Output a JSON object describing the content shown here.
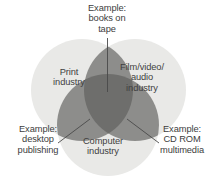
{
  "diagram": {
    "type": "venn-3-circle",
    "background_color": "#ffffff",
    "circle_fill": "#e9e9e7",
    "pair_overlap_fill": "#8d8d8b",
    "triple_overlap_fill": "#6e6e6c",
    "text_color": "#3d3d3d",
    "leader_line_color": "#4a4a4a"
  },
  "sets": [
    {
      "id": "print",
      "label": "Print\nindustry",
      "position": "left"
    },
    {
      "id": "film_video_audio",
      "label": "Film/video/\naudio\nindustry",
      "position": "right"
    },
    {
      "id": "computer",
      "label": "Computer\nindustry",
      "position": "bottom"
    }
  ],
  "intersections": [
    {
      "id": "print_film",
      "label": "Example:\nbooks on\ntape",
      "sets": [
        "print",
        "film_video_audio"
      ],
      "position": "top"
    },
    {
      "id": "print_computer",
      "label": "Example:\ndesktop\npublishing",
      "sets": [
        "print",
        "computer"
      ],
      "position": "bottom-left"
    },
    {
      "id": "film_computer",
      "label": "Example:\nCD ROM\nmultimedia",
      "sets": [
        "film_video_audio",
        "computer"
      ],
      "position": "bottom-right"
    }
  ]
}
